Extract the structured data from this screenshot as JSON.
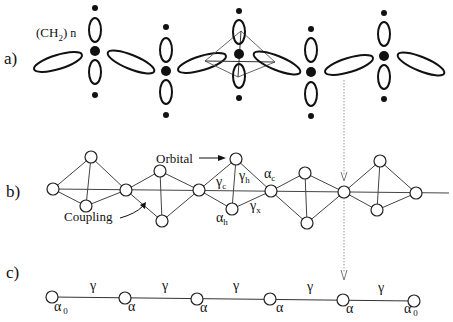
{
  "colors": {
    "ink": "#111111",
    "thin_line": "#555555",
    "dotted": "#999999",
    "background": "#ffffff"
  },
  "panel_a": {
    "label": "a)",
    "group_label": "(CH",
    "group_sub": "2",
    "group_close": ")",
    "group_n": "n"
  },
  "panel_b": {
    "label": "b)",
    "orbital_label": "Orbital",
    "coupling_label": "Coupling",
    "gamma": "γ",
    "alpha": "α",
    "sub_c": "c",
    "sub_h": "h",
    "sub_x": "x"
  },
  "panel_c": {
    "label": "c)",
    "gamma": "γ",
    "alpha": "α",
    "alpha0_sub": "0",
    "bond_labels": [
      "γ",
      "γ",
      "γ",
      "γ",
      "γ",
      "γ"
    ],
    "site_labels": [
      "α0",
      "α",
      "α",
      "α",
      "α",
      "α",
      "α0"
    ]
  }
}
